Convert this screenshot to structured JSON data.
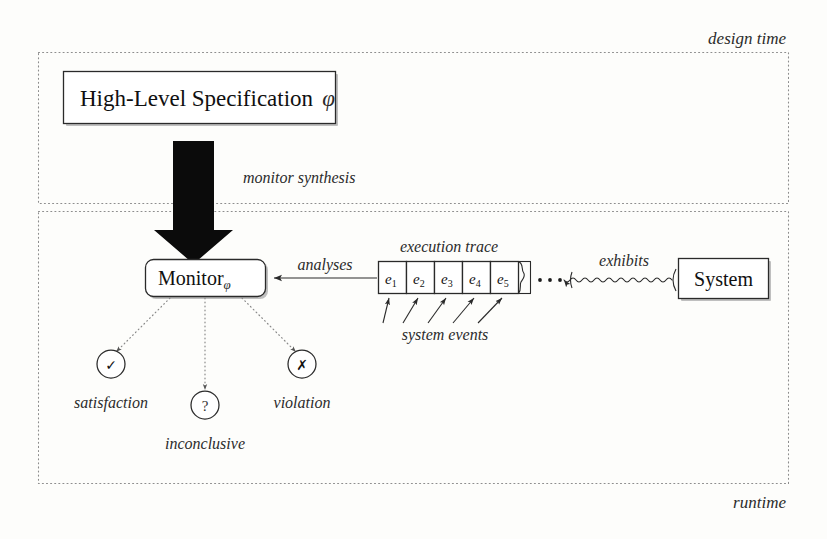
{
  "figure": {
    "background_color": "#fdfdfb",
    "ink_color": "#2a2a2a"
  },
  "phases": {
    "design_time": {
      "label": "design time",
      "position": "top-right"
    },
    "runtime": {
      "label": "runtime",
      "position": "bottom-right"
    }
  },
  "nodes": {
    "specification": {
      "label": "High-Level Specification",
      "symbol": "φ",
      "shape": "rectangle"
    },
    "monitor": {
      "label": "Monitor",
      "subscript": "φ",
      "shape": "rounded-rectangle"
    },
    "system": {
      "label": "System",
      "shape": "rectangle"
    }
  },
  "edges": {
    "synthesis": {
      "label": "monitor synthesis",
      "style": "thick-block-arrow",
      "direction": "down",
      "from": "specification",
      "to": "monitor"
    },
    "analyses": {
      "label": "analyses",
      "style": "solid-arrow",
      "direction": "left",
      "from": "execution-trace",
      "to": "monitor"
    },
    "exhibits": {
      "label": "exhibits",
      "style": "squiggly-arrow",
      "direction": "left",
      "from": "system",
      "to": "execution-trace"
    }
  },
  "trace": {
    "title": "execution trace",
    "caption": "system events",
    "continuation": "· · ·",
    "events": [
      {
        "base": "e",
        "index": "1"
      },
      {
        "base": "e",
        "index": "2"
      },
      {
        "base": "e",
        "index": "3"
      },
      {
        "base": "e",
        "index": "4"
      },
      {
        "base": "e",
        "index": "5"
      }
    ]
  },
  "verdicts": [
    {
      "name": "satisfaction",
      "label": "satisfaction",
      "glyph": "✓",
      "glyph_name": "check-icon"
    },
    {
      "name": "inconclusive",
      "label": "inconclusive",
      "glyph": "?",
      "glyph_name": "question-icon"
    },
    {
      "name": "violation",
      "label": "violation",
      "glyph": "✗",
      "glyph_name": "cross-icon"
    }
  ]
}
